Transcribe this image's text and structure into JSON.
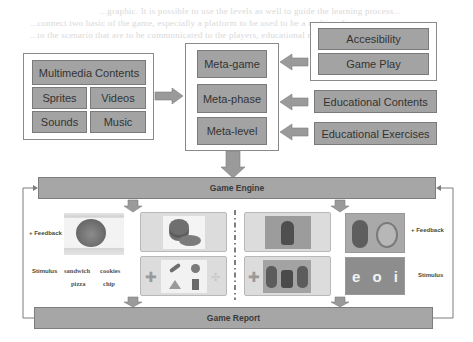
{
  "diagram": {
    "bleed_text": [
      "...graphic. It is possible to use the levels as well to guide the learning process...",
      "...connect two basic of the game, especially a platform to be used to be a multimedia...",
      "...to the scenario that are to be communicated to the players, educational methodologies..."
    ],
    "multimedia": {
      "title": "Multimedia Contents",
      "items": [
        "Sprites",
        "Videos",
        "Sounds",
        "Music"
      ]
    },
    "meta": {
      "items": [
        "Meta-game",
        "Meta-phase",
        "Meta-level"
      ]
    },
    "right_group": {
      "items": [
        "Accesibility",
        "Game Play"
      ]
    },
    "educational_contents": "Educational Contents",
    "educational_exercises": "Educational Exercises",
    "game_engine": "Game Engine",
    "game_report": "Game Report",
    "left_panel": {
      "feedback_label": "+ Feedback",
      "stimulus_label": "Stimulus",
      "food_words": [
        "sandwich",
        "cookies",
        "pizza",
        "chip"
      ]
    },
    "right_panel": {
      "feedback_label": "+ Feedback",
      "stimulus_label": "Stimulus",
      "vowels": [
        "e",
        "o",
        "i"
      ]
    },
    "colors": {
      "box_fill": "#a3a3a3",
      "box_border": "#7a7a7a",
      "arrow_fill": "#9a9a9a",
      "text": "#333333"
    }
  }
}
